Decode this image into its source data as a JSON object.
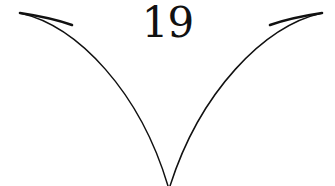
{
  "page": {
    "background_color": "#ffffff",
    "ink_color": "#111111",
    "width": 335,
    "height": 186
  },
  "folio": {
    "number": "19",
    "position": "top-center",
    "font_size_px": 42,
    "baseline_y": 45,
    "center_x": 169
  },
  "ornament": {
    "name": "double-swoop-rule",
    "description": "Two mirrored tapering curves sweeping down from the upper corners to a narrow V vertex at the bottom center",
    "stroke_color": "#111111",
    "stroke_width_px": 1.5,
    "vertex": {
      "x": 168,
      "y": 186
    },
    "left_curve": {
      "start": {
        "x": 20,
        "y": 13
      },
      "control_1": {
        "x": 78,
        "y": 26
      },
      "control_2": {
        "x": 140,
        "y": 92
      },
      "end": {
        "x": 168,
        "y": 186
      }
    },
    "right_curve": {
      "start": {
        "x": 322,
        "y": 13
      },
      "control_1": {
        "x": 264,
        "y": 26
      },
      "control_2": {
        "x": 200,
        "y": 92
      },
      "end": {
        "x": 170,
        "y": 186
      }
    }
  }
}
